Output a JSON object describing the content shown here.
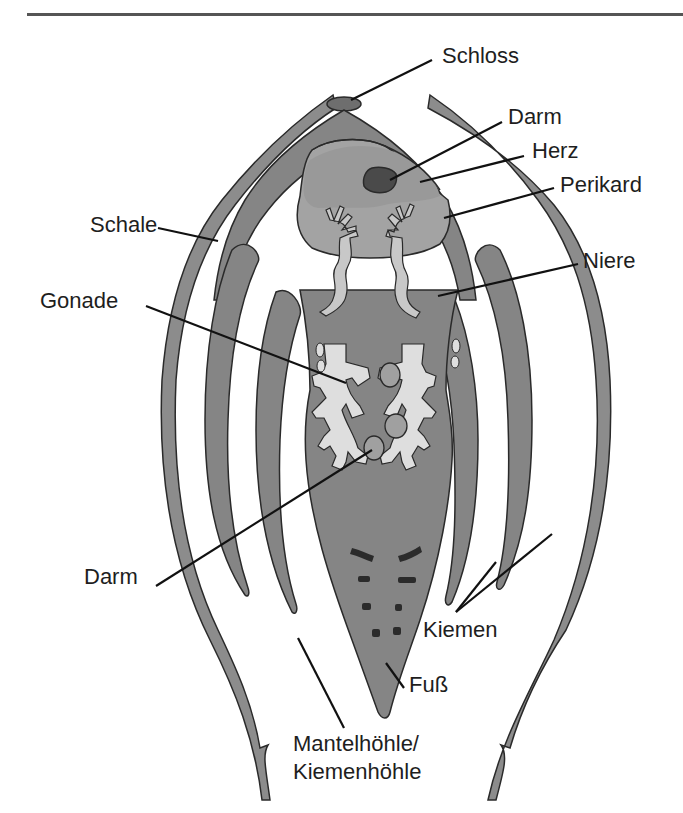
{
  "header": {
    "title_clipped": "",
    "rule": true
  },
  "colors": {
    "background": "#ffffff",
    "shell": "#8c8c8c",
    "body": "#858585",
    "outline": "#2a2a2a",
    "pericard_light": "#a3a3a3",
    "heart_band": "#999999",
    "darm_dark": "#4a4a4a",
    "nephridia_light": "#d2d2d2",
    "gonade_light": "#dedede",
    "foot_marks": "#2b2b2b",
    "label_text": "#1e1e1e",
    "leader_line": "#111111"
  },
  "diagram": {
    "labels": [
      {
        "id": "schloss",
        "text": "Schloss",
        "x": 442,
        "y": 63
      },
      {
        "id": "darm_top",
        "text": "Darm",
        "x": 508,
        "y": 124
      },
      {
        "id": "herz",
        "text": "Herz",
        "x": 532,
        "y": 158
      },
      {
        "id": "perikard",
        "text": "Perikard",
        "x": 560,
        "y": 192
      },
      {
        "id": "schale",
        "text": "Schale",
        "x": 90,
        "y": 232
      },
      {
        "id": "niere",
        "text": "Niere",
        "x": 583,
        "y": 268
      },
      {
        "id": "gonade",
        "text": "Gonade",
        "x": 40,
        "y": 308
      },
      {
        "id": "darm_bottom",
        "text": "Darm",
        "x": 84,
        "y": 584
      },
      {
        "id": "kiemen",
        "text": "Kiemen",
        "x": 423,
        "y": 637
      },
      {
        "id": "fuss",
        "text": "Fuß",
        "x": 409,
        "y": 692
      },
      {
        "id": "mantelhoehle_1",
        "text": "Mantelhöhle/",
        "x": 293,
        "y": 751
      },
      {
        "id": "mantelhoehle_2",
        "text": "Kiemenhöhle",
        "x": 293,
        "y": 779
      }
    ]
  }
}
